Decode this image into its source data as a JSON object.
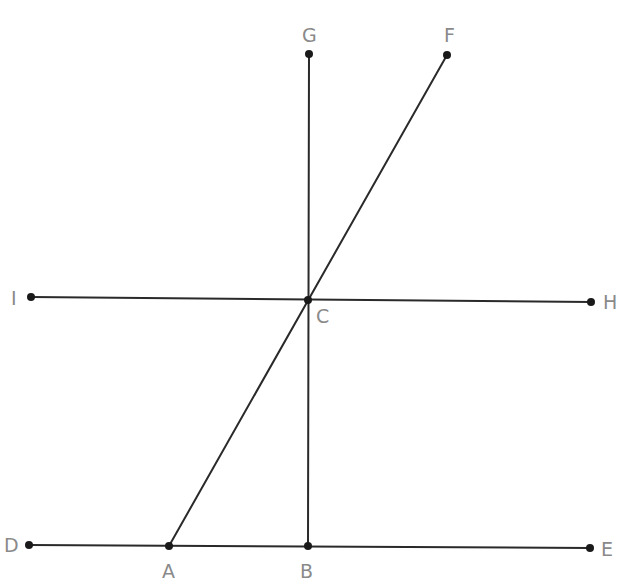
{
  "diagram": {
    "type": "geometry",
    "colors": {
      "line": "#2a2a2a",
      "point": "#1a1a1a",
      "label": "#8a8a8a",
      "background": "#ffffff"
    },
    "points": {
      "A": {
        "x": 169,
        "y": 546,
        "label": "A",
        "lx": 162,
        "ly": 578
      },
      "B": {
        "x": 308,
        "y": 546,
        "label": "B",
        "lx": 300,
        "ly": 578
      },
      "C": {
        "x": 308,
        "y": 300,
        "label": "C",
        "lx": 316,
        "ly": 323
      },
      "D": {
        "x": 29,
        "y": 545,
        "label": "D",
        "lx": 4,
        "ly": 552
      },
      "E": {
        "x": 590,
        "y": 548,
        "label": "E",
        "lx": 601,
        "ly": 556
      },
      "F": {
        "x": 447,
        "y": 55,
        "label": "F",
        "lx": 444,
        "ly": 42
      },
      "G": {
        "x": 309,
        "y": 54,
        "label": "G",
        "lx": 302,
        "ly": 42
      },
      "H": {
        "x": 591,
        "y": 302,
        "label": "H",
        "lx": 603,
        "ly": 309
      },
      "I": {
        "x": 31,
        "y": 297,
        "label": "I",
        "lx": 11,
        "ly": 305
      }
    },
    "segments": [
      {
        "name": "segment-DE",
        "from": "D",
        "to": "E"
      },
      {
        "name": "segment-IH",
        "from": "I",
        "to": "H"
      },
      {
        "name": "segment-GB",
        "from": "G",
        "to": "B"
      },
      {
        "name": "segment-AF",
        "from": "A",
        "to": "F"
      }
    ]
  }
}
